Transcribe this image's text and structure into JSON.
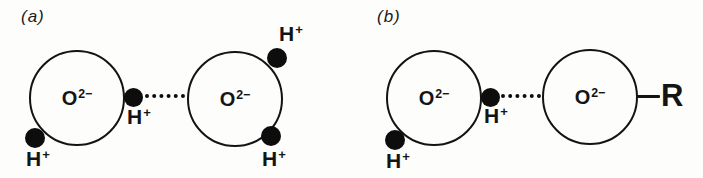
{
  "figure": {
    "background": "#fdfdfc",
    "ink": "#141414",
    "panels": [
      {
        "label": "(a)",
        "molecules": [
          {
            "symbol": "O",
            "charge": "2−"
          },
          {
            "symbol": "O",
            "charge": "2−"
          }
        ],
        "protons": [
          {
            "symbol": "H",
            "charge": "+",
            "position": "left-circle-lower-left"
          },
          {
            "symbol": "H",
            "charge": "+",
            "position": "left-circle-right-bridging"
          },
          {
            "symbol": "H",
            "charge": "+",
            "position": "right-circle-upper-right"
          },
          {
            "symbol": "H",
            "charge": "+",
            "position": "right-circle-lower-right"
          }
        ],
        "hydrogen_bond_style": "dotted"
      },
      {
        "label": "(b)",
        "molecules": [
          {
            "symbol": "O",
            "charge": "2−"
          },
          {
            "symbol": "O",
            "charge": "2−"
          }
        ],
        "protons": [
          {
            "symbol": "H",
            "charge": "+",
            "position": "left-circle-lower-left"
          },
          {
            "symbol": "H",
            "charge": "+",
            "position": "left-circle-right-bridging"
          }
        ],
        "hydrogen_bond_style": "dotted",
        "substituent": {
          "label": "R"
        }
      }
    ]
  }
}
